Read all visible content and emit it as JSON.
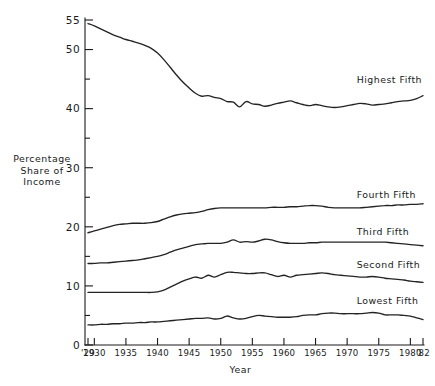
{
  "chart_data": {
    "type": "line",
    "title": "",
    "xlabel": "Year",
    "ylabel": "Percentage Share of Income",
    "ylabel_lines": [
      "Percentage",
      "Share of",
      "Income"
    ],
    "xlim": [
      1929,
      1982
    ],
    "ylim": [
      0,
      55
    ],
    "grid": false,
    "legend_position": "inline-right-of-series",
    "y_ticks_major": [
      0,
      10,
      20,
      30,
      40,
      50,
      55
    ],
    "y_tick_labels": [
      "0",
      "10",
      "20",
      "30",
      "40",
      "50",
      "55"
    ],
    "y_ticks_minor": [
      5,
      15,
      25,
      35,
      45
    ],
    "x_ticks": [
      1929,
      1930,
      1935,
      1940,
      1945,
      1950,
      1955,
      1960,
      1965,
      1970,
      1975,
      1980,
      1982
    ],
    "x_tick_labels": [
      "'29",
      "1930",
      "1935",
      "1940",
      "1945",
      "1950",
      "1955",
      "1960",
      "1965",
      "1970",
      "1975",
      "1980",
      "'82"
    ],
    "x": [
      1929,
      1930,
      1931,
      1932,
      1933,
      1934,
      1935,
      1936,
      1937,
      1938,
      1939,
      1940,
      1941,
      1942,
      1943,
      1944,
      1945,
      1946,
      1947,
      1948,
      1949,
      1950,
      1951,
      1952,
      1953,
      1954,
      1955,
      1956,
      1957,
      1958,
      1959,
      1960,
      1961,
      1962,
      1963,
      1964,
      1965,
      1966,
      1967,
      1968,
      1969,
      1970,
      1971,
      1972,
      1973,
      1974,
      1975,
      1976,
      1977,
      1978,
      1979,
      1980,
      1981,
      1982
    ],
    "series": [
      {
        "name": "Highest Fifth",
        "label": "Highest Fifth",
        "label_x": 1971.5,
        "label_y": 44.3,
        "values": [
          54.4,
          54.0,
          53.5,
          53.0,
          52.5,
          52.1,
          51.7,
          51.4,
          51.1,
          50.7,
          50.2,
          49.4,
          48.3,
          47.0,
          45.7,
          44.5,
          43.5,
          42.6,
          42.1,
          42.2,
          41.9,
          41.7,
          41.2,
          41.1,
          40.3,
          41.2,
          40.8,
          40.7,
          40.4,
          40.6,
          40.9,
          41.1,
          41.3,
          41.0,
          40.7,
          40.5,
          40.7,
          40.5,
          40.3,
          40.2,
          40.3,
          40.5,
          40.7,
          40.9,
          40.8,
          40.6,
          40.7,
          40.8,
          41.0,
          41.2,
          41.3,
          41.4,
          41.7,
          42.2
        ]
      },
      {
        "name": "Fourth Fifth",
        "label": "Fourth Fifth",
        "label_x": 1971.5,
        "label_y": 24.9,
        "values": [
          19.0,
          19.3,
          19.6,
          19.9,
          20.2,
          20.4,
          20.5,
          20.6,
          20.6,
          20.6,
          20.7,
          20.9,
          21.3,
          21.7,
          22.0,
          22.2,
          22.3,
          22.4,
          22.6,
          22.9,
          23.1,
          23.2,
          23.2,
          23.2,
          23.2,
          23.2,
          23.2,
          23.2,
          23.2,
          23.3,
          23.3,
          23.3,
          23.4,
          23.4,
          23.5,
          23.6,
          23.6,
          23.5,
          23.3,
          23.2,
          23.2,
          23.2,
          23.2,
          23.2,
          23.3,
          23.4,
          23.5,
          23.6,
          23.6,
          23.7,
          23.7,
          23.8,
          23.8,
          23.9
        ]
      },
      {
        "name": "Third Fifth",
        "label": "Third Fifth",
        "label_x": 1971.5,
        "label_y": 18.7,
        "values": [
          13.8,
          13.8,
          13.9,
          13.9,
          14.0,
          14.1,
          14.2,
          14.3,
          14.4,
          14.6,
          14.8,
          15.0,
          15.3,
          15.7,
          16.1,
          16.4,
          16.7,
          17.0,
          17.1,
          17.2,
          17.2,
          17.2,
          17.4,
          17.8,
          17.4,
          17.5,
          17.4,
          17.6,
          17.9,
          17.8,
          17.5,
          17.3,
          17.2,
          17.2,
          17.2,
          17.3,
          17.3,
          17.4,
          17.4,
          17.4,
          17.4,
          17.4,
          17.4,
          17.4,
          17.4,
          17.4,
          17.4,
          17.4,
          17.3,
          17.2,
          17.1,
          17.0,
          16.9,
          16.8
        ]
      },
      {
        "name": "Second Fifth",
        "label": "Second Fifth",
        "label_x": 1971.5,
        "label_y": 13.1,
        "values": [
          8.9,
          8.9,
          8.9,
          8.9,
          8.9,
          8.9,
          8.9,
          8.9,
          8.9,
          8.9,
          8.9,
          9.0,
          9.3,
          9.8,
          10.3,
          10.8,
          11.2,
          11.5,
          11.3,
          11.8,
          11.5,
          11.9,
          12.3,
          12.3,
          12.2,
          12.1,
          12.1,
          12.2,
          12.2,
          11.9,
          11.6,
          11.8,
          11.5,
          11.8,
          11.9,
          12.0,
          12.1,
          12.2,
          12.1,
          11.9,
          11.8,
          11.7,
          11.6,
          11.5,
          11.5,
          11.6,
          11.5,
          11.3,
          11.2,
          11.1,
          11.0,
          10.8,
          10.7,
          10.6
        ]
      },
      {
        "name": "Lowest Fifth",
        "label": "Lowest Fifth",
        "label_x": 1971.5,
        "label_y": 7.0,
        "values": [
          3.4,
          3.4,
          3.5,
          3.5,
          3.6,
          3.6,
          3.7,
          3.7,
          3.8,
          3.8,
          3.9,
          3.9,
          4.0,
          4.1,
          4.2,
          4.3,
          4.4,
          4.5,
          4.5,
          4.6,
          4.4,
          4.5,
          4.9,
          4.6,
          4.4,
          4.5,
          4.8,
          5.0,
          4.9,
          4.8,
          4.7,
          4.7,
          4.7,
          4.8,
          5.0,
          5.1,
          5.1,
          5.3,
          5.4,
          5.4,
          5.3,
          5.3,
          5.3,
          5.3,
          5.4,
          5.5,
          5.4,
          5.1,
          5.1,
          5.1,
          5.0,
          4.9,
          4.6,
          4.3
        ]
      }
    ]
  },
  "figure": {
    "background_color": "#ffffff",
    "line_color": "#232323",
    "axis_color": "#1a1a1a"
  }
}
